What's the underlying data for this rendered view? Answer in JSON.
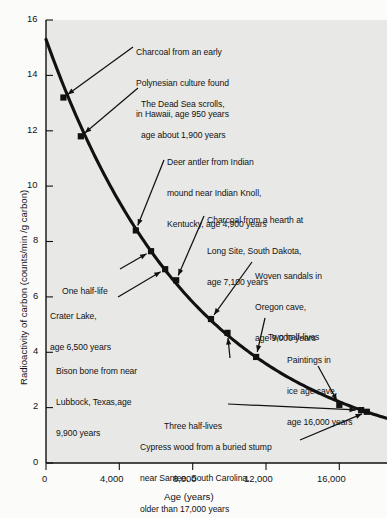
{
  "figure": {
    "background_color": "#fbfbfa",
    "plot_background_color": "#e8e8e6",
    "curve_color": "#111111",
    "marker_color": "#111111"
  },
  "axes": {
    "x_title": "Age (years)",
    "y_title": "Radioactivity of carbon (counts/min /g carbon)",
    "x_ticks": [
      "0",
      "4,000",
      "8,000",
      "12,000",
      "16,000"
    ],
    "y_ticks": [
      "0",
      "2",
      "4",
      "6",
      "8",
      "10",
      "12",
      "14",
      "16"
    ]
  },
  "chart_data": {
    "type": "line",
    "title": "",
    "xlabel": "Age (years)",
    "ylabel": "Radioactivity of carbon (counts/min /g carbon)",
    "xlim": [
      0,
      18600
    ],
    "ylim": [
      0,
      16
    ],
    "xticks": [
      0,
      4000,
      8000,
      12000,
      16000
    ],
    "xticklabels": [
      "0",
      "4,000",
      "8,000",
      "12,000",
      "16,000"
    ],
    "yticks": [
      0,
      2,
      4,
      6,
      8,
      10,
      12,
      14,
      16
    ],
    "yticklabels": [
      "0",
      "2",
      "4",
      "6",
      "8",
      "10",
      "12",
      "14",
      "16"
    ],
    "grid": false,
    "legend": "none",
    "curve_description": "Exponential radiocarbon decay curve, initial activity 15.3 counts/min/g, half-life 5,730 years",
    "curve": {
      "initial_activity": 15.3,
      "half_life_years": 5730,
      "x": [
        0,
        950,
        1900,
        3000,
        4900,
        5730,
        6500,
        7100,
        9000,
        9900,
        11460,
        13000,
        16000,
        17190,
        17500
      ],
      "y": [
        15.3,
        13.2,
        11.8,
        10.5,
        8.4,
        7.65,
        7.0,
        6.6,
        5.2,
        4.7,
        3.83,
        3.1,
        2.1,
        1.91,
        1.85
      ]
    },
    "points": [
      {
        "name": "charcoal-hawaii",
        "x": 950,
        "y": 13.2,
        "label": "Charcoal from an early\nPolynesian culture found\nin Hawaii, age 950 years",
        "age_years": 950
      },
      {
        "name": "dead-sea-scrolls",
        "x": 1900,
        "y": 11.8,
        "label": "The Dead Sea scrolls,\nage about 1,900 years",
        "age_years": 1900
      },
      {
        "name": "deer-antler",
        "x": 4900,
        "y": 8.4,
        "label": "Deer antler from Indian\nmound near Indian Knoll,\nKentucky, age 4,900 years",
        "age_years": 4900
      },
      {
        "name": "one-half-life",
        "x": 5730,
        "y": 7.65,
        "label": "One half-life",
        "age_years": 5730
      },
      {
        "name": "crater-lake",
        "x": 6500,
        "y": 7.0,
        "label": "Crater Lake,\nage 6,500 years",
        "age_years": 6500
      },
      {
        "name": "charcoal-long-site",
        "x": 7100,
        "y": 6.6,
        "label": "Charcoal from a hearth at\nLong Site, South Dakota,\nage 7,100 years",
        "age_years": 7100
      },
      {
        "name": "woven-sandals",
        "x": 9000,
        "y": 5.2,
        "label": "Woven sandals in\nOregon cave,\nage 9,000 years",
        "age_years": 9000
      },
      {
        "name": "bison-bone",
        "x": 9900,
        "y": 4.7,
        "label": "Bison bone from near\nLubbock, Texas,age\n9,900 years",
        "age_years": 9900
      },
      {
        "name": "two-half-lives",
        "x": 11460,
        "y": 3.83,
        "label": "Two half-lives",
        "age_years": 11460
      },
      {
        "name": "ice-age-paintings",
        "x": 16000,
        "y": 2.1,
        "label": "Paintings in\nice age cave,\nage 16,000 years",
        "age_years": 16000
      },
      {
        "name": "three-half-lives",
        "x": 17190,
        "y": 1.91,
        "label": "Three half-lives",
        "age_years": 17190
      },
      {
        "name": "cypress-wood",
        "x": 17500,
        "y": 1.85,
        "label": "Cypress wood from a buried stump\nnear Santee, South Carolina,\nolder than 17,000 years",
        "age_years": 17000
      }
    ]
  },
  "annotations": {
    "charcoal_hawaii": {
      "line1": "Charcoal from an early",
      "line2": "Polynesian culture found",
      "line3": "in Hawaii, age 950 years"
    },
    "dead_sea": {
      "line1": "The Dead Sea scrolls,",
      "line2": "age about 1,900 years"
    },
    "deer_antler": {
      "line1": "Deer antler from Indian",
      "line2": "mound near Indian Knoll,",
      "line3": "Kentucky, age 4,900 years"
    },
    "long_site": {
      "line1": "Charcoal from a hearth at",
      "line2": "Long Site, South Dakota,",
      "line3": "age 7,100 years"
    },
    "one_half_life": {
      "line1": "One half-life"
    },
    "crater_lake": {
      "line1": "Crater Lake,",
      "line2": "age 6,500 years"
    },
    "woven_sandals": {
      "line1": "Woven sandals in",
      "line2": "Oregon cave,",
      "line3": "age 9,000 years"
    },
    "bison_bone": {
      "line1": "Bison bone from near",
      "line2": "Lubbock, Texas,age",
      "line3": "9,900 years"
    },
    "two_half_lives": {
      "line1": "Two half-lives"
    },
    "ice_age": {
      "line1": "Paintings in",
      "line2": "ice age cave,",
      "line3": "age 16,000 years"
    },
    "three_half_lives": {
      "line1": "Three half-lives"
    },
    "cypress": {
      "line1": "Cypress wood from a buried stump",
      "line2": "near Santee, South Carolina,",
      "line3": "older than 17,000 years"
    }
  }
}
